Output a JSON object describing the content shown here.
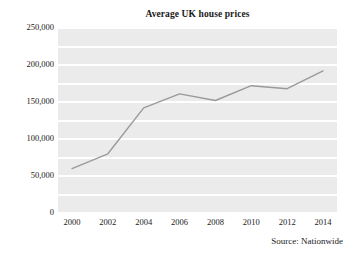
{
  "chart_data": {
    "type": "line",
    "title": "Average UK house prices",
    "xlabel": "",
    "ylabel": "",
    "x": [
      2000,
      2002,
      2004,
      2006,
      2008,
      2010,
      2012,
      2014
    ],
    "categories": [
      "2000",
      "2002",
      "2004",
      "2006",
      "2008",
      "2010",
      "2012",
      "2014"
    ],
    "series": [
      {
        "name": "Average UK house price",
        "values": [
          60000,
          80000,
          142000,
          161000,
          152000,
          172000,
          168000,
          192000
        ],
        "color": "#9a9a9a"
      }
    ],
    "xlim": [
      2000,
      2014
    ],
    "ylim": [
      0,
      250000
    ],
    "y_ticks": [
      0,
      50000,
      100000,
      150000,
      200000,
      250000
    ],
    "y_tick_labels": [
      "0",
      "50,000",
      "100,000",
      "150,000",
      "200,000",
      "250,000"
    ],
    "x_ticks": [
      2000,
      2002,
      2004,
      2006,
      2008,
      2010,
      2012,
      2014
    ],
    "x_tick_labels": [
      "2000",
      "2002",
      "2004",
      "2006",
      "2008",
      "2010",
      "2012",
      "2014"
    ],
    "gridlines": {
      "horizontal": true,
      "vertical": false,
      "interval": 25000,
      "color": "#ffffff"
    },
    "legend": {
      "visible": false,
      "position": "none"
    },
    "plot_background": "#ebebeb",
    "figure_background": "#ffffff",
    "annotations": [
      {
        "name": "source-note",
        "text": "Source: Nationwide",
        "position": "bottom-right"
      }
    ]
  },
  "footer": {
    "source": "Source: Nationwide"
  }
}
